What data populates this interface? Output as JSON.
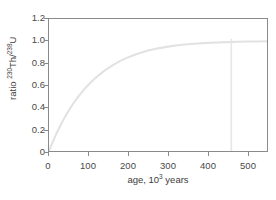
{
  "chart_data": {
    "type": "line",
    "title": "",
    "xlabel": "age, 10³ years",
    "ylabel": "ratio ²³⁰Th/²³⁸U",
    "xlabel_parts": {
      "prefix": "age, 10",
      "exponent": "3",
      "suffix": " years"
    },
    "ylabel_parts": {
      "prefix": "ratio ",
      "sup1": "230",
      "mid": "Th/",
      "sup2": "238",
      "suffix": "U"
    },
    "xlim": [
      0,
      550
    ],
    "ylim": [
      0,
      1.2
    ],
    "xticks": [
      0,
      100,
      200,
      300,
      400,
      500
    ],
    "xticklabels": [
      "0",
      "100",
      "200",
      "300",
      "400",
      "500"
    ],
    "yticks": [
      0,
      0.2,
      0.4,
      0.6,
      0.8,
      1.0,
      1.2
    ],
    "yticklabels": [
      "0",
      "0.2",
      "0.4",
      "0.6",
      "0.8",
      "1.0",
      "1.2"
    ],
    "grid": false,
    "legend": null,
    "series": [
      {
        "name": "230Th/238U ingrowth",
        "color": "#e2e2e2",
        "x": [
          0,
          10,
          20,
          30,
          40,
          50,
          60,
          70,
          80,
          90,
          100,
          120,
          140,
          160,
          180,
          200,
          225,
          250,
          275,
          300,
          325,
          350,
          375,
          400,
          425,
          450,
          475,
          500,
          525,
          550
        ],
        "y": [
          0.0,
          0.088,
          0.168,
          0.241,
          0.308,
          0.369,
          0.425,
          0.476,
          0.522,
          0.565,
          0.604,
          0.673,
          0.731,
          0.779,
          0.819,
          0.853,
          0.887,
          0.913,
          0.933,
          0.949,
          0.961,
          0.971,
          0.978,
          0.983,
          0.987,
          0.99,
          0.993,
          0.995,
          0.996,
          0.997
        ]
      }
    ],
    "annotations": [
      {
        "name": "dating-limit-line",
        "type": "vline",
        "x": 460,
        "y_top": 1.02,
        "y_bottom": 0.0,
        "color": "#e6e6e6",
        "label": ""
      }
    ]
  }
}
